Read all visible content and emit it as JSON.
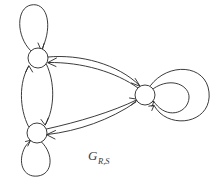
{
  "figure": {
    "kind": "directed-graph-diagram",
    "label": {
      "base": "G",
      "subscript": "R,S"
    },
    "colors": {
      "stroke": "#262626",
      "node_fill": "#ffffff",
      "background": "#ffffff",
      "label": "#3a3a3a"
    },
    "nodes": [
      {
        "id": "n1",
        "name": "top-left-node",
        "cx": 38,
        "cy": 58,
        "r": 10
      },
      {
        "id": "n2",
        "name": "bottom-left-node",
        "cx": 37,
        "cy": 133,
        "r": 10
      },
      {
        "id": "n3",
        "name": "right-node",
        "cx": 145,
        "cy": 95,
        "r": 10
      }
    ],
    "edges": [
      {
        "id": "e1",
        "name": "self-loop-top-left",
        "from": "n1",
        "to": "n1",
        "kind": "self-loop",
        "direction": "up"
      },
      {
        "id": "e2",
        "name": "self-loop-bottom-left",
        "from": "n2",
        "to": "n2",
        "kind": "self-loop",
        "direction": "down"
      },
      {
        "id": "e3",
        "name": "self-loop-right-inner",
        "from": "n3",
        "to": "n3",
        "kind": "self-loop",
        "direction": "right-inner"
      },
      {
        "id": "e4",
        "name": "self-loop-right-outer",
        "from": "n3",
        "to": "n3",
        "kind": "self-loop",
        "direction": "right-outer"
      },
      {
        "id": "e5",
        "name": "edge-top-left-to-bottom-left",
        "from": "n1",
        "to": "n2",
        "kind": "curve"
      },
      {
        "id": "e6",
        "name": "edge-bottom-left-to-top-left",
        "from": "n2",
        "to": "n1",
        "kind": "curve"
      },
      {
        "id": "e7",
        "name": "edge-top-left-to-right",
        "from": "n1",
        "to": "n3",
        "kind": "curve"
      },
      {
        "id": "e8",
        "name": "edge-right-to-top-left",
        "from": "n3",
        "to": "n1",
        "kind": "curve"
      },
      {
        "id": "e9",
        "name": "edge-bottom-left-to-right",
        "from": "n2",
        "to": "n3",
        "kind": "curve"
      },
      {
        "id": "e10",
        "name": "edge-right-to-bottom-left",
        "from": "n3",
        "to": "n2",
        "kind": "curve"
      }
    ],
    "counts": {
      "nodes": 3,
      "edges": 10
    }
  }
}
